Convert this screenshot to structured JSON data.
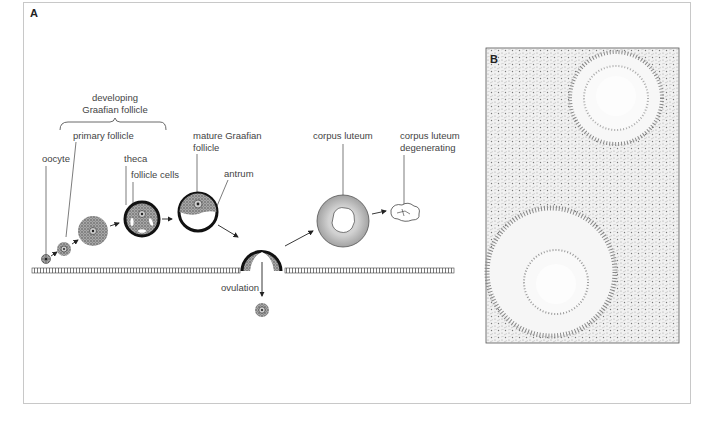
{
  "figure": {
    "panel_a_label": "A",
    "panel_b_label": "B",
    "labels": {
      "developing_line1": "developing",
      "developing_line2": "Graafian follicle",
      "primary_follicle": "primary follicle",
      "oocyte": "oocyte",
      "theca": "theca",
      "follicle_cells": "follicle cells",
      "mature_line1": "mature Graafian",
      "mature_line2": "follicle",
      "antrum": "antrum",
      "corpus_luteum": "corpus luteum",
      "cl_deg_line1": "corpus luteum",
      "cl_deg_line2": "degenerating",
      "ovulation": "ovulation"
    },
    "colors": {
      "stroke": "#222222",
      "granulosa_fill": "#8a8a8a",
      "corpus_luteum_fill": "#b5b5b5",
      "frame_border": "#c8c8c8"
    }
  }
}
